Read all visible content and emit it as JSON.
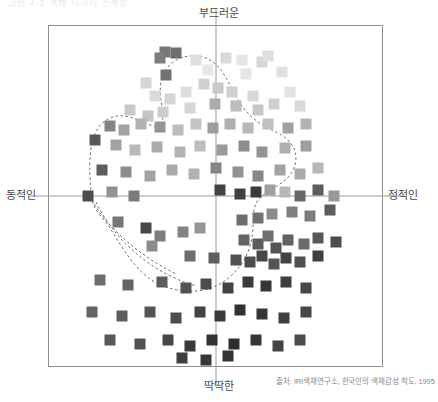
{
  "figure": {
    "top_scrap": "그림 4-2  색채 이미지 스케일",
    "source": "출처: IRI색채연구소, 한국인의 색채감성 척도, 1995"
  },
  "axes": {
    "top_label": "부드러운",
    "bottom_label": "딱딱한",
    "left_label": "동적인",
    "right_label": "정적인",
    "center_x": 216,
    "center_y": 196,
    "frame": {
      "x": 48,
      "y": 25,
      "w": 335,
      "h": 342
    },
    "line_color": "#9a9a9a",
    "frame_color": "#8d8d8d"
  },
  "chart_data": {
    "type": "scatter",
    "title": "",
    "subtitle": "",
    "xlabel": "동적인 ↔ 정적인",
    "ylabel": "딱딱한 ↔ 부드러운",
    "xlim": [
      -1,
      1
    ],
    "ylim": [
      -1,
      1
    ],
    "grid": false,
    "legend": "none",
    "marker": "square",
    "marker_size_px": 11,
    "annotations": [
      "dashed boundary hull enclosing the color-sample cloud"
    ],
    "axis_cross": {
      "x": 0,
      "y": 0
    },
    "hull_path": "M 92,200 C 86,150 92,126 110,118 C 128,110 146,126 160,128 C 168,118 156,96 162,78 C 168,58 190,52 206,58 C 224,66 228,84 238,100 C 250,120 264,126 276,132 C 292,140 300,152 294,168 C 288,184 266,190 258,200 C 250,212 256,226 250,246 C 244,268 224,286 204,290 C 184,294 160,288 146,276 C 130,262 120,244 110,228 C 100,214 94,210 92,200 Z",
    "inner_path": "M 96,202 C 112,236 148,272 196,286",
    "tail_path": "M 92,200 C 104,222 132,252 176,274",
    "points": [
      {
        "x": 165,
        "y": 52,
        "v": 0.42
      },
      {
        "x": 176,
        "y": 53,
        "v": 0.38
      },
      {
        "x": 160,
        "y": 58,
        "v": 0.45
      },
      {
        "x": 166,
        "y": 75,
        "v": 0.4
      },
      {
        "x": 146,
        "y": 83,
        "v": 0.86
      },
      {
        "x": 196,
        "y": 60,
        "v": 0.9
      },
      {
        "x": 226,
        "y": 58,
        "v": 0.88
      },
      {
        "x": 242,
        "y": 60,
        "v": 0.93
      },
      {
        "x": 262,
        "y": 62,
        "v": 0.86
      },
      {
        "x": 268,
        "y": 56,
        "v": 0.9
      },
      {
        "x": 208,
        "y": 70,
        "v": 0.94
      },
      {
        "x": 246,
        "y": 74,
        "v": 0.93
      },
      {
        "x": 282,
        "y": 72,
        "v": 0.91
      },
      {
        "x": 155,
        "y": 96,
        "v": 0.88
      },
      {
        "x": 170,
        "y": 99,
        "v": 0.86
      },
      {
        "x": 186,
        "y": 92,
        "v": 0.9
      },
      {
        "x": 204,
        "y": 84,
        "v": 0.84
      },
      {
        "x": 218,
        "y": 88,
        "v": 0.8
      },
      {
        "x": 232,
        "y": 92,
        "v": 0.83
      },
      {
        "x": 253,
        "y": 96,
        "v": 0.87
      },
      {
        "x": 290,
        "y": 92,
        "v": 0.92
      },
      {
        "x": 130,
        "y": 110,
        "v": 0.8
      },
      {
        "x": 148,
        "y": 116,
        "v": 0.78
      },
      {
        "x": 163,
        "y": 112,
        "v": 0.82
      },
      {
        "x": 190,
        "y": 108,
        "v": 0.86
      },
      {
        "x": 215,
        "y": 104,
        "v": 0.66
      },
      {
        "x": 236,
        "y": 106,
        "v": 0.74
      },
      {
        "x": 258,
        "y": 110,
        "v": 0.79
      },
      {
        "x": 274,
        "y": 104,
        "v": 0.84
      },
      {
        "x": 300,
        "y": 106,
        "v": 0.88
      },
      {
        "x": 110,
        "y": 126,
        "v": 0.48
      },
      {
        "x": 124,
        "y": 130,
        "v": 0.62
      },
      {
        "x": 141,
        "y": 124,
        "v": 0.7
      },
      {
        "x": 160,
        "y": 127,
        "v": 0.56
      },
      {
        "x": 178,
        "y": 130,
        "v": 0.74
      },
      {
        "x": 196,
        "y": 124,
        "v": 0.78
      },
      {
        "x": 213,
        "y": 128,
        "v": 0.6
      },
      {
        "x": 230,
        "y": 124,
        "v": 0.68
      },
      {
        "x": 248,
        "y": 128,
        "v": 0.72
      },
      {
        "x": 268,
        "y": 124,
        "v": 0.76
      },
      {
        "x": 288,
        "y": 128,
        "v": 0.62
      },
      {
        "x": 306,
        "y": 124,
        "v": 0.7
      },
      {
        "x": 95,
        "y": 140,
        "v": 0.28
      },
      {
        "x": 116,
        "y": 145,
        "v": 0.62
      },
      {
        "x": 135,
        "y": 150,
        "v": 0.72
      },
      {
        "x": 157,
        "y": 147,
        "v": 0.66
      },
      {
        "x": 180,
        "y": 152,
        "v": 0.7
      },
      {
        "x": 200,
        "y": 146,
        "v": 0.74
      },
      {
        "x": 222,
        "y": 150,
        "v": 0.58
      },
      {
        "x": 244,
        "y": 146,
        "v": 0.52
      },
      {
        "x": 262,
        "y": 152,
        "v": 0.56
      },
      {
        "x": 285,
        "y": 148,
        "v": 0.68
      },
      {
        "x": 306,
        "y": 146,
        "v": 0.6
      },
      {
        "x": 102,
        "y": 170,
        "v": 0.3
      },
      {
        "x": 126,
        "y": 172,
        "v": 0.52
      },
      {
        "x": 150,
        "y": 176,
        "v": 0.62
      },
      {
        "x": 172,
        "y": 170,
        "v": 0.66
      },
      {
        "x": 194,
        "y": 174,
        "v": 0.7
      },
      {
        "x": 216,
        "y": 168,
        "v": 0.48
      },
      {
        "x": 238,
        "y": 172,
        "v": 0.54
      },
      {
        "x": 258,
        "y": 176,
        "v": 0.5
      },
      {
        "x": 280,
        "y": 170,
        "v": 0.62
      },
      {
        "x": 300,
        "y": 174,
        "v": 0.66
      },
      {
        "x": 318,
        "y": 168,
        "v": 0.72
      },
      {
        "x": 88,
        "y": 196,
        "v": 0.22
      },
      {
        "x": 112,
        "y": 192,
        "v": 0.55
      },
      {
        "x": 134,
        "y": 196,
        "v": 0.44
      },
      {
        "x": 220,
        "y": 190,
        "v": 0.18
      },
      {
        "x": 240,
        "y": 194,
        "v": 0.16
      },
      {
        "x": 256,
        "y": 192,
        "v": 0.14
      },
      {
        "x": 270,
        "y": 190,
        "v": 0.6
      },
      {
        "x": 285,
        "y": 192,
        "v": 0.72
      },
      {
        "x": 300,
        "y": 196,
        "v": 0.35
      },
      {
        "x": 318,
        "y": 190,
        "v": 0.3
      },
      {
        "x": 334,
        "y": 196,
        "v": 0.58
      },
      {
        "x": 118,
        "y": 222,
        "v": 0.42
      },
      {
        "x": 146,
        "y": 228,
        "v": 0.2
      },
      {
        "x": 160,
        "y": 236,
        "v": 0.45
      },
      {
        "x": 152,
        "y": 246,
        "v": 0.52
      },
      {
        "x": 183,
        "y": 232,
        "v": 0.48
      },
      {
        "x": 200,
        "y": 228,
        "v": 0.56
      },
      {
        "x": 242,
        "y": 220,
        "v": 0.38
      },
      {
        "x": 258,
        "y": 218,
        "v": 0.4
      },
      {
        "x": 272,
        "y": 214,
        "v": 0.52
      },
      {
        "x": 292,
        "y": 212,
        "v": 0.46
      },
      {
        "x": 310,
        "y": 216,
        "v": 0.44
      },
      {
        "x": 330,
        "y": 210,
        "v": 0.3
      },
      {
        "x": 244,
        "y": 240,
        "v": 0.34
      },
      {
        "x": 258,
        "y": 244,
        "v": 0.3
      },
      {
        "x": 268,
        "y": 236,
        "v": 0.38
      },
      {
        "x": 276,
        "y": 248,
        "v": 0.26
      },
      {
        "x": 288,
        "y": 240,
        "v": 0.32
      },
      {
        "x": 304,
        "y": 244,
        "v": 0.36
      },
      {
        "x": 318,
        "y": 238,
        "v": 0.28
      },
      {
        "x": 336,
        "y": 242,
        "v": 0.22
      },
      {
        "x": 190,
        "y": 256,
        "v": 0.38
      },
      {
        "x": 214,
        "y": 258,
        "v": 0.3
      },
      {
        "x": 236,
        "y": 260,
        "v": 0.24
      },
      {
        "x": 250,
        "y": 262,
        "v": 0.22
      },
      {
        "x": 262,
        "y": 256,
        "v": 0.2
      },
      {
        "x": 274,
        "y": 264,
        "v": 0.26
      },
      {
        "x": 286,
        "y": 258,
        "v": 0.18
      },
      {
        "x": 300,
        "y": 262,
        "v": 0.24
      },
      {
        "x": 318,
        "y": 256,
        "v": 0.16
      },
      {
        "x": 100,
        "y": 280,
        "v": 0.38
      },
      {
        "x": 128,
        "y": 285,
        "v": 0.34
      },
      {
        "x": 162,
        "y": 282,
        "v": 0.3
      },
      {
        "x": 186,
        "y": 288,
        "v": 0.26
      },
      {
        "x": 206,
        "y": 284,
        "v": 0.22
      },
      {
        "x": 228,
        "y": 288,
        "v": 0.18
      },
      {
        "x": 248,
        "y": 282,
        "v": 0.14
      },
      {
        "x": 266,
        "y": 286,
        "v": 0.12
      },
      {
        "x": 286,
        "y": 282,
        "v": 0.16
      },
      {
        "x": 306,
        "y": 288,
        "v": 0.2
      },
      {
        "x": 92,
        "y": 312,
        "v": 0.34
      },
      {
        "x": 122,
        "y": 316,
        "v": 0.3
      },
      {
        "x": 150,
        "y": 312,
        "v": 0.26
      },
      {
        "x": 176,
        "y": 318,
        "v": 0.22
      },
      {
        "x": 200,
        "y": 312,
        "v": 0.18
      },
      {
        "x": 220,
        "y": 316,
        "v": 0.14
      },
      {
        "x": 240,
        "y": 310,
        "v": 0.1
      },
      {
        "x": 262,
        "y": 314,
        "v": 0.12
      },
      {
        "x": 284,
        "y": 318,
        "v": 0.16
      },
      {
        "x": 306,
        "y": 312,
        "v": 0.2
      },
      {
        "x": 110,
        "y": 340,
        "v": 0.28
      },
      {
        "x": 140,
        "y": 344,
        "v": 0.24
      },
      {
        "x": 168,
        "y": 340,
        "v": 0.2
      },
      {
        "x": 190,
        "y": 346,
        "v": 0.14
      },
      {
        "x": 212,
        "y": 340,
        "v": 0.1
      },
      {
        "x": 234,
        "y": 344,
        "v": 0.08
      },
      {
        "x": 256,
        "y": 340,
        "v": 0.12
      },
      {
        "x": 278,
        "y": 346,
        "v": 0.18
      },
      {
        "x": 300,
        "y": 340,
        "v": 0.22
      },
      {
        "x": 182,
        "y": 358,
        "v": 0.16
      },
      {
        "x": 206,
        "y": 360,
        "v": 0.12
      },
      {
        "x": 228,
        "y": 356,
        "v": 0.1
      }
    ]
  }
}
